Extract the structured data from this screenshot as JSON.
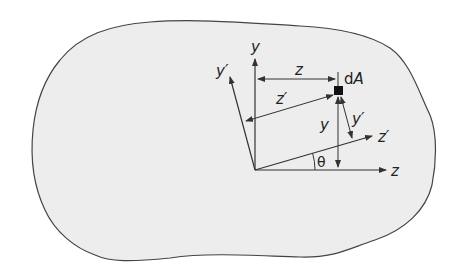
{
  "figure": {
    "colors": {
      "background": "#ffffff",
      "region_fill": "#ededed",
      "stroke": "#333333",
      "element": "#111111"
    },
    "labels": {
      "y_axis": "y",
      "z_axis": "z",
      "y_prime_axis": "y′",
      "z_prime_axis": "z′",
      "dim_z": "z",
      "dim_z_prime": "z′",
      "dim_y": "y",
      "dim_y_prime": "y′",
      "element_d": "d",
      "element_A": "A",
      "angle": "θ"
    }
  }
}
